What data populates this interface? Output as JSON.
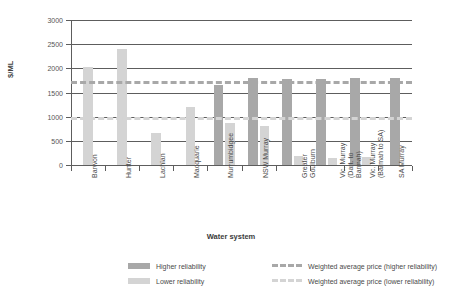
{
  "chart_data": {
    "type": "bar",
    "title": "",
    "xlabel": "Water system",
    "ylabel": "$/ML",
    "ylim": [
      0,
      3000
    ],
    "yticks": [
      0,
      500,
      1000,
      1500,
      2000,
      2500,
      3000
    ],
    "ytick_labels": [
      "0",
      "500",
      "1000",
      "1500",
      "2000",
      "2500",
      "3000"
    ],
    "grid": true,
    "legend_position": "bottom",
    "categories": [
      "Barwon",
      "Hunter",
      "Lachlan",
      "Macquarie",
      "Murrumbidgee",
      "NSW Murray",
      "Greater Goulburn",
      "Vic. Murray (Dart. to Barmah)",
      "Vic. Murray (Barmah to SA)",
      "SA Murray"
    ],
    "category_lines": [
      [
        "Barwon"
      ],
      [
        "Hunter"
      ],
      [
        "Lachlan"
      ],
      [
        "Macquarie"
      ],
      [
        "Murrumbidgee"
      ],
      [
        "NSW Murray"
      ],
      [
        "Greater",
        "Goulburn"
      ],
      [
        "Vic. Murray",
        "(Dart. to",
        "Barmah)"
      ],
      [
        "Vic. Murray",
        "(Barmah to SA)"
      ],
      [
        "SA Murray"
      ]
    ],
    "series": [
      {
        "name": "Higher reliability",
        "color": "#a8a8a8",
        "values": [
          null,
          null,
          null,
          null,
          1660,
          1790,
          1780,
          1780,
          1790,
          1800
        ]
      },
      {
        "name": "Lower reliability",
        "color": "#d4d4d4",
        "values": [
          2030,
          2400,
          660,
          1190,
          870,
          800,
          180,
          145,
          175,
          null
        ]
      }
    ],
    "reference_lines": [
      {
        "name": "Weighted average price (higher reliability)",
        "value": 1740,
        "color": "#a8a8a8",
        "style": "dashed"
      },
      {
        "name": "Weighted average price (lower reliability)",
        "value": 1000,
        "color": "#d4d4d4",
        "style": "dashed"
      }
    ]
  },
  "legend": {
    "items": [
      {
        "label": "Higher reliability",
        "kind": "swatch",
        "variant": "high"
      },
      {
        "label": "Lower reliability",
        "kind": "swatch",
        "variant": "low"
      },
      {
        "label": "Weighted average price (higher reliability)",
        "kind": "dash",
        "variant": "high"
      },
      {
        "label": "Weighted average price (lower reliability)",
        "kind": "dash",
        "variant": "low"
      }
    ]
  }
}
